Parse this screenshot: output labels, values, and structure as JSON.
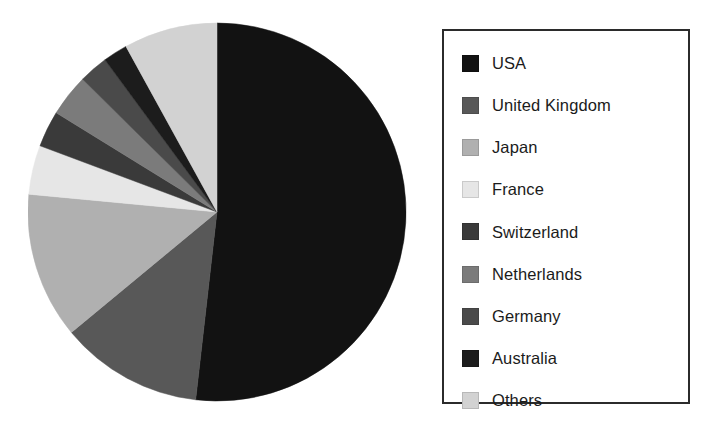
{
  "chart_data": {
    "type": "pie",
    "title": "",
    "subtitle": "",
    "xlabel": "",
    "ylabel": "",
    "grid": false,
    "legend_position": "right",
    "start_angle_deg": 90,
    "direction": "clockwise",
    "categories": [
      "USA",
      "United Kingdom",
      "Japan",
      "France",
      "Switzerland",
      "Netherlands",
      "Germany",
      "Australia",
      "Others"
    ],
    "values": [
      51.8,
      12.2,
      12.5,
      4.2,
      3.1,
      3.6,
      2.5,
      2.1,
      8.0
    ],
    "unit": "percent",
    "colors": [
      "#121212",
      "#585858",
      "#b0b0b0",
      "#e6e6e6",
      "#3a3a3a",
      "#7b7b7b",
      "#4a4a4a",
      "#1c1c1c",
      "#d2d2d2"
    ],
    "slices": [
      {
        "label": "USA",
        "value": 51.8,
        "color": "#121212"
      },
      {
        "label": "United Kingdom",
        "value": 12.2,
        "color": "#585858"
      },
      {
        "label": "Japan",
        "value": 12.5,
        "color": "#b0b0b0"
      },
      {
        "label": "France",
        "value": 4.2,
        "color": "#e6e6e6"
      },
      {
        "label": "Switzerland",
        "value": 3.1,
        "color": "#3a3a3a"
      },
      {
        "label": "Netherlands",
        "value": 3.6,
        "color": "#7b7b7b"
      },
      {
        "label": "Germany",
        "value": 2.5,
        "color": "#4a4a4a"
      },
      {
        "label": "Australia",
        "value": 2.1,
        "color": "#1c1c1c"
      },
      {
        "label": "Others",
        "value": 8.0,
        "color": "#d2d2d2"
      }
    ]
  },
  "legend": {
    "items": [
      {
        "label": "USA",
        "color": "#121212",
        "swatch": "legend-swatch-usa"
      },
      {
        "label": "United Kingdom",
        "color": "#585858",
        "swatch": "legend-swatch-united-kingdom"
      },
      {
        "label": "Japan",
        "color": "#b0b0b0",
        "swatch": "legend-swatch-japan"
      },
      {
        "label": "France",
        "color": "#e6e6e6",
        "swatch": "legend-swatch-france"
      },
      {
        "label": "Switzerland",
        "color": "#3a3a3a",
        "swatch": "legend-swatch-switzerland"
      },
      {
        "label": "Netherlands",
        "color": "#7b7b7b",
        "swatch": "legend-swatch-netherlands"
      },
      {
        "label": "Germany",
        "color": "#4a4a4a",
        "swatch": "legend-swatch-germany"
      },
      {
        "label": "Australia",
        "color": "#1c1c1c",
        "swatch": "legend-swatch-australia"
      },
      {
        "label": "Others",
        "color": "#d2d2d2",
        "swatch": "legend-swatch-others"
      }
    ],
    "border_color": "#2b2b2b"
  },
  "canvas": {
    "background": "#ffffff"
  }
}
